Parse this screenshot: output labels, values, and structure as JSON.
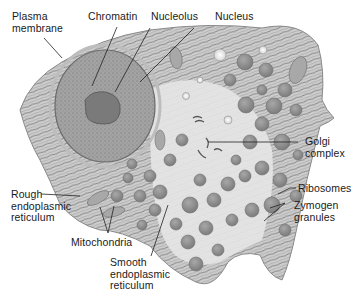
{
  "figure": {
    "colors": {
      "background": "#ffffff",
      "cytoplasm": "#d8d8d8",
      "nucleus": "#9c9c9c",
      "nucleolus": "#7a7a7a",
      "granule": "#8f8f8f",
      "leader_line": "#222222",
      "label_text": "#1a1a1a"
    }
  },
  "labels": {
    "plasma_membrane": "Plasma\nmembrane",
    "chromatin": "Chromatin",
    "nucleolus": "Nucleolus",
    "nucleus": "Nucleus",
    "golgi_complex": "Golgi\ncomplex",
    "ribosomes": "Ribosomes",
    "zymogen_granules": "Zymogen\ngranules",
    "rough_er": "Rough\nendoplasmic\nreticulum",
    "mitochondria": "Mitochondria",
    "smooth_er": "Smooth\nendoplasmic\nreticulum"
  }
}
